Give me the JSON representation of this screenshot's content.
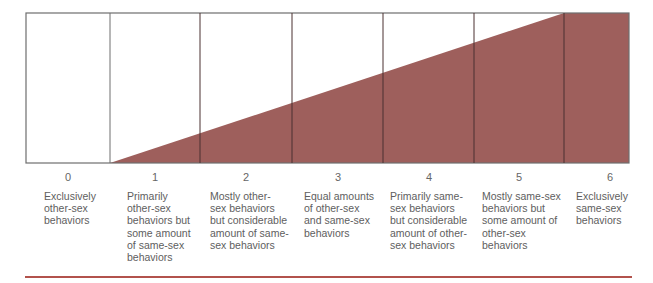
{
  "diagram": {
    "type": "scale",
    "fill_color": "#9e5f5c",
    "border_color": "#6e6e6e",
    "rule_color": "#b2524c",
    "columns": [
      {
        "number": "0",
        "label": "Exclusively other-sex behaviors",
        "lines": [
          "Exclusively",
          "other-sex",
          "behaviors"
        ]
      },
      {
        "number": "1",
        "label": "Primarily other-sex behaviors but some amount of same-sex behaviors",
        "lines": [
          "Primarily",
          "other-sex",
          "behaviors but",
          "some amount",
          "of same-sex",
          "behaviors"
        ]
      },
      {
        "number": "2",
        "label": "Mostly other-sex behaviors but considerable amount of same-sex behaviors",
        "lines": [
          "Mostly other-",
          "sex behaviors",
          "but considerable",
          "amount of same-",
          "sex behaviors"
        ]
      },
      {
        "number": "3",
        "label": "Equal amounts of other-sex and same-sex behaviors",
        "lines": [
          "Equal amounts",
          "of other-sex",
          "and same-sex",
          "behaviors"
        ]
      },
      {
        "number": "4",
        "label": "Primarily same-sex behaviors but considerable amount of other-sex behaviors",
        "lines": [
          "Primarily same-",
          "sex behaviors",
          "but considerable",
          "amount of other-",
          "sex behaviors"
        ]
      },
      {
        "number": "5",
        "label": "Mostly same-sex behaviors but some amount of other-sex behaviors",
        "lines": [
          "Mostly same-sex",
          "behaviors but",
          "some amount of",
          "other-sex",
          "behaviors"
        ]
      },
      {
        "number": "6",
        "label": "Exclusively same-sex behaviors",
        "lines": [
          "Exclusively",
          "same-sex",
          "behaviors"
        ]
      }
    ]
  }
}
